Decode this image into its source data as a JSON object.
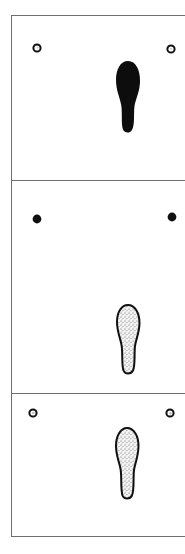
{
  "figure": {
    "description": "Three stacked panels, each with two reference markers and a single footprint",
    "panels": [
      {
        "id": "panel-1",
        "markers": [
          {
            "position": "left",
            "style": "ring",
            "cx": 37,
            "cy": 48
          },
          {
            "position": "right",
            "style": "ring",
            "cx": 171,
            "cy": 49
          }
        ],
        "footprint": {
          "fill": "solid-black",
          "cx": 128,
          "top": 61,
          "bottom": 133
        }
      },
      {
        "id": "panel-2",
        "markers": [
          {
            "position": "left",
            "style": "solid",
            "cx": 37,
            "cy": 219
          },
          {
            "position": "right",
            "style": "solid",
            "cx": 172,
            "cy": 217
          }
        ],
        "footprint": {
          "fill": "stippled-outline",
          "cx": 128,
          "top": 305,
          "bottom": 375
        }
      },
      {
        "id": "panel-3",
        "markers": [
          {
            "position": "left",
            "style": "ring",
            "cx": 33,
            "cy": 413
          },
          {
            "position": "right",
            "style": "ring",
            "cx": 170,
            "cy": 413
          }
        ],
        "footprint": {
          "fill": "stippled-outline",
          "cx": 127,
          "top": 428,
          "bottom": 500
        }
      }
    ],
    "colors": {
      "ink": "#111111",
      "frame": "#6e6e6e",
      "stipple_bg": "#e8e8e8",
      "background": "#ffffff"
    }
  }
}
